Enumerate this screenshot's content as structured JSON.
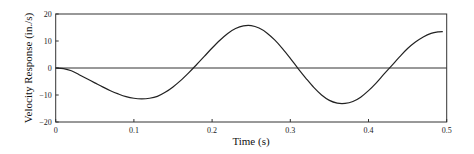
{
  "chart_data": {
    "type": "line",
    "title": "",
    "xlabel": "Time (s)",
    "ylabel": "Velocity Response (in./s)",
    "xlim": [
      0,
      0.5
    ],
    "ylim": [
      -20,
      20
    ],
    "x_ticks": [
      0,
      0.1,
      0.2,
      0.3,
      0.4,
      0.5
    ],
    "x_tick_labels": [
      "0",
      "0.1",
      "0.2",
      "0.3",
      "0.4",
      "0.5"
    ],
    "y_ticks": [
      -20,
      -10,
      0,
      10,
      20
    ],
    "y_tick_labels": [
      "-20",
      "-10",
      "0",
      "10",
      "20"
    ],
    "grid": false,
    "legend": null,
    "zero_line": true,
    "series": [
      {
        "name": "Velocity response",
        "color": "#222222",
        "x": [
          0,
          0.01,
          0.02,
          0.03,
          0.04,
          0.05,
          0.06,
          0.07,
          0.08,
          0.09,
          0.1,
          0.11,
          0.12,
          0.13,
          0.14,
          0.15,
          0.16,
          0.17,
          0.18,
          0.19,
          0.2,
          0.21,
          0.22,
          0.23,
          0.24,
          0.25,
          0.26,
          0.27,
          0.28,
          0.29,
          0.3,
          0.31,
          0.32,
          0.33,
          0.34,
          0.35,
          0.36,
          0.37,
          0.38,
          0.39,
          0.4,
          0.41,
          0.42,
          0.43,
          0.44,
          0.45,
          0.46,
          0.47,
          0.48,
          0.49,
          0.495
        ],
        "values": [
          0,
          -0.2,
          -1.0,
          -2.5,
          -4.0,
          -5.5,
          -7.0,
          -8.4,
          -9.6,
          -10.6,
          -11.2,
          -11.4,
          -11.2,
          -10.5,
          -9.0,
          -7.0,
          -4.6,
          -1.8,
          1.2,
          4.3,
          7.4,
          10.3,
          12.8,
          14.6,
          15.6,
          15.7,
          14.8,
          13.0,
          10.4,
          7.2,
          3.6,
          -0.2,
          -3.8,
          -7.2,
          -10.0,
          -12.0,
          -13.0,
          -13.1,
          -12.4,
          -10.8,
          -8.4,
          -5.5,
          -2.2,
          1.0,
          4.2,
          7.2,
          9.6,
          11.5,
          12.8,
          13.4,
          13.5
        ]
      }
    ]
  }
}
